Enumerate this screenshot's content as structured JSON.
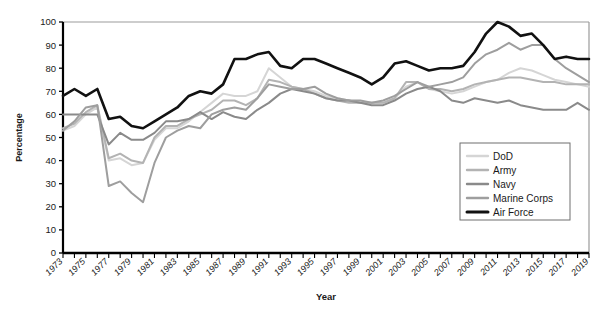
{
  "chart_data": {
    "type": "line",
    "title": "",
    "xlabel": "Year",
    "ylabel": "Percentage",
    "xlim": [
      1973,
      2019
    ],
    "ylim": [
      0,
      100
    ],
    "grid": false,
    "legend_position": "bottom-right",
    "y_ticks": [
      0,
      10,
      20,
      30,
      40,
      50,
      60,
      70,
      80,
      90,
      100
    ],
    "x_tick_labels": [
      "1973",
      "1975",
      "1977",
      "1979",
      "1981",
      "1983",
      "1985",
      "1987",
      "1989",
      "1991",
      "1993",
      "1995",
      "1997",
      "1999",
      "2001",
      "2003",
      "2005",
      "2007",
      "2009",
      "2011",
      "2013",
      "2015",
      "2017",
      "2019"
    ],
    "x": [
      1973,
      1974,
      1975,
      1976,
      1977,
      1978,
      1979,
      1980,
      1981,
      1982,
      1983,
      1984,
      1985,
      1986,
      1987,
      1988,
      1989,
      1990,
      1991,
      1992,
      1993,
      1994,
      1995,
      1996,
      1997,
      1998,
      1999,
      2000,
      2001,
      2002,
      2003,
      2004,
      2005,
      2006,
      2007,
      2008,
      2009,
      2010,
      2011,
      2012,
      2013,
      2014,
      2015,
      2016,
      2017,
      2018,
      2019
    ],
    "series": [
      {
        "name": "DoD",
        "color": "#d5d5d5",
        "width": 2.0,
        "values": [
          53,
          55,
          60,
          63,
          40,
          41,
          38,
          39,
          49,
          54,
          54,
          57,
          61,
          65,
          69,
          68,
          68,
          70,
          80,
          76,
          72,
          71,
          70,
          68,
          67,
          66,
          65,
          65,
          65,
          67,
          72,
          74,
          71,
          70,
          69,
          70,
          72,
          74,
          75,
          78,
          80,
          79,
          77,
          75,
          74,
          73,
          72
        ]
      },
      {
        "name": "Army",
        "color": "#b3b3b3",
        "width": 2.0,
        "values": [
          54,
          56,
          61,
          64,
          41,
          43,
          40,
          39,
          50,
          55,
          55,
          58,
          60,
          62,
          66,
          66,
          64,
          67,
          75,
          74,
          72,
          71,
          69,
          67,
          66,
          65,
          65,
          65,
          65,
          67,
          74,
          74,
          71,
          71,
          70,
          71,
          73,
          74,
          75,
          76,
          76,
          75,
          74,
          74,
          73,
          73,
          73
        ]
      },
      {
        "name": "Navy",
        "color": "#8a8a8a",
        "width": 2.0,
        "values": [
          60,
          60,
          60,
          60,
          47,
          52,
          49,
          49,
          52,
          57,
          57,
          58,
          61,
          58,
          61,
          59,
          58,
          62,
          65,
          69,
          71,
          70,
          69,
          67,
          66,
          66,
          65,
          64,
          64,
          66,
          69,
          71,
          72,
          70,
          66,
          65,
          67,
          66,
          65,
          66,
          64,
          63,
          62,
          62,
          62,
          65,
          62
        ]
      },
      {
        "name": "Marine Corps",
        "color": "#9e9e9e",
        "width": 2.0,
        "values": [
          53,
          57,
          63,
          64,
          29,
          31,
          26,
          22,
          39,
          50,
          53,
          55,
          54,
          60,
          62,
          63,
          62,
          67,
          73,
          72,
          71,
          71,
          72,
          69,
          67,
          66,
          66,
          65,
          66,
          68,
          71,
          74,
          72,
          73,
          74,
          76,
          82,
          86,
          88,
          91,
          88,
          90,
          90,
          84,
          80,
          77,
          74
        ]
      },
      {
        "name": "Air Force",
        "color": "#111111",
        "width": 2.6,
        "values": [
          68,
          71,
          68,
          71,
          58,
          59,
          55,
          54,
          57,
          60,
          63,
          68,
          70,
          69,
          73,
          84,
          84,
          86,
          87,
          81,
          80,
          84,
          84,
          82,
          80,
          78,
          76,
          73,
          76,
          82,
          83,
          81,
          79,
          80,
          80,
          81,
          87,
          95,
          100,
          98,
          94,
          95,
          90,
          84,
          85,
          84,
          84
        ]
      }
    ]
  },
  "legend": {
    "entries": [
      {
        "label": "DoD"
      },
      {
        "label": "Army"
      },
      {
        "label": "Navy"
      },
      {
        "label": "Marine Corps"
      },
      {
        "label": "Air Force"
      }
    ]
  }
}
